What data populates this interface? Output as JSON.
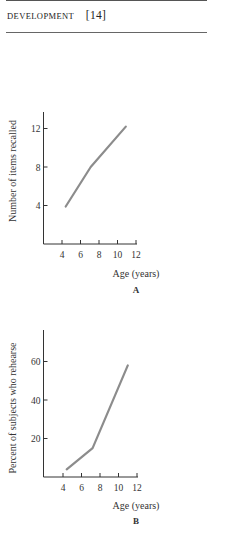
{
  "header": {
    "section": "DEVELOPMENT",
    "page": "[14]"
  },
  "colors": {
    "axis": "#333333",
    "line": "#8c8c8c",
    "text": "#333333"
  },
  "chart_data": [
    {
      "type": "line",
      "panel": "A",
      "title": "",
      "xlabel": "Age (years)",
      "ylabel": "Number of items recalled",
      "caption": "A",
      "x_ticks": [
        4,
        6,
        8,
        10,
        12
      ],
      "y_ticks": [
        4,
        8,
        12
      ],
      "xlim": [
        3,
        12
      ],
      "ylim": [
        0,
        14
      ],
      "grid": false,
      "legend": null,
      "series": [
        {
          "name": "Items recalled",
          "x": [
            4.4,
            7.1,
            10.9
          ],
          "y": [
            3.9,
            8.0,
            12.2
          ]
        }
      ]
    },
    {
      "type": "line",
      "panel": "B",
      "title": "",
      "xlabel": "Age (years)",
      "ylabel": "Percent of subjects who rehearse",
      "caption": "B",
      "x_ticks": [
        4,
        6,
        8,
        10,
        12
      ],
      "y_ticks": [
        20,
        40,
        60
      ],
      "xlim": [
        3,
        12
      ],
      "ylim": [
        0,
        75
      ],
      "grid": false,
      "legend": null,
      "series": [
        {
          "name": "Percent who rehearse",
          "x": [
            4.4,
            7.2,
            11.0
          ],
          "y": [
            4,
            15,
            58
          ]
        }
      ]
    }
  ]
}
